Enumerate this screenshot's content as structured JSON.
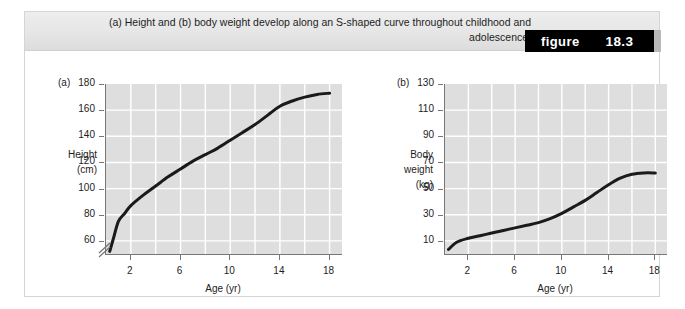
{
  "figure": {
    "caption": "(a) Height and (b) body weight develop along an S-shaped curve throughout childhood and adolescence.",
    "badge_word": "figure",
    "badge_number": "18.3",
    "badge_bg": "#000000",
    "badge_text_color": "#ffffff",
    "header_bg": "#e8e8e8",
    "plot_bg": "#dedede",
    "grid_color": "#ffffff",
    "curve_color": "#1a1a1a"
  },
  "chart_data": [
    {
      "type": "line",
      "panel_tag": "(a)",
      "title": "",
      "ylabel_lines": [
        "Height",
        "(cm)"
      ],
      "xlabel": "Age (yr)",
      "ylim": [
        50,
        180
      ],
      "xlim": [
        0,
        19
      ],
      "yticks": [
        60,
        80,
        100,
        120,
        140,
        160,
        180
      ],
      "xticks": [
        2,
        6,
        10,
        14,
        18
      ],
      "grid": true,
      "y_axis_break": true,
      "series": [
        {
          "name": "Height",
          "x": [
            0.3,
            0.6,
            1,
            1.5,
            2,
            3,
            4,
            5,
            6,
            7,
            8,
            9,
            10,
            11,
            12,
            13,
            14,
            15,
            16,
            17,
            18
          ],
          "values": [
            52,
            62,
            75,
            81,
            87,
            95,
            102,
            109,
            115,
            121,
            126,
            131,
            137,
            143,
            149,
            156,
            163,
            167,
            170,
            172,
            173
          ]
        }
      ]
    },
    {
      "type": "line",
      "panel_tag": "(b)",
      "title": "",
      "ylabel_lines": [
        "Body",
        "weight",
        "(kg)"
      ],
      "xlabel": "Age (yr)",
      "ylim": [
        0,
        130
      ],
      "xlim": [
        0,
        19
      ],
      "yticks": [
        10,
        30,
        50,
        70,
        90,
        110,
        130
      ],
      "xticks": [
        2,
        6,
        10,
        14,
        18
      ],
      "grid": true,
      "y_axis_break": false,
      "series": [
        {
          "name": "Body weight",
          "x": [
            0.3,
            1,
            2,
            3,
            4,
            5,
            6,
            7,
            8,
            9,
            10,
            11,
            12,
            13,
            14,
            15,
            16,
            17,
            18
          ],
          "values": [
            3.5,
            9,
            12,
            14,
            16,
            18,
            20,
            22,
            24,
            27,
            31,
            36,
            41,
            47,
            53,
            58,
            61,
            62,
            62
          ]
        }
      ]
    }
  ]
}
